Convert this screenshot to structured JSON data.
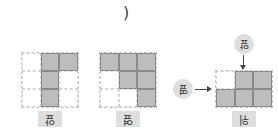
{
  "header": {
    "paren": ")"
  },
  "figures": [
    {
      "label": "앞",
      "cols": 3,
      "rows": 3,
      "filled": [
        [
          0,
          1,
          1
        ],
        [
          0,
          1,
          0
        ],
        [
          0,
          1,
          0
        ]
      ]
    },
    {
      "label": "옆",
      "cols": 3,
      "rows": 3,
      "filled": [
        [
          1,
          1,
          1
        ],
        [
          0,
          1,
          1
        ],
        [
          0,
          0,
          1
        ]
      ]
    },
    {
      "label": "위",
      "cols": 3,
      "rows": 2,
      "filled": [
        [
          0,
          1,
          1
        ],
        [
          1,
          1,
          1
        ]
      ]
    }
  ],
  "arrows": {
    "top_label": "앞",
    "left_label": "옆"
  },
  "colors": {
    "filled": "#bdbdbd",
    "border": "#8a8a8a",
    "label_bg": "#dedede"
  }
}
